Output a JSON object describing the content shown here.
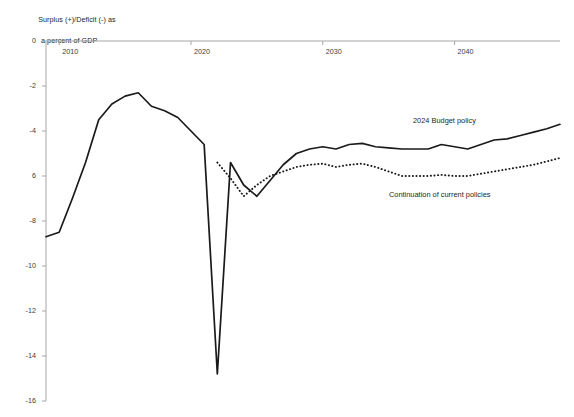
{
  "chart_data": {
    "type": "line",
    "title": "Surplus (+)/Deficit (-) as a percent of GDP",
    "title_line1": "Surplus (+)/Deficit (-) as",
    "title_line2": "a percent of GDP",
    "xlabel": "",
    "ylabel": "Surplus (+)/Deficit (-) as a percent of GDP",
    "xlim": [
      2009,
      2048
    ],
    "ylim": [
      -16,
      0
    ],
    "grid": false,
    "legend_position": "inline-annotation",
    "x_ticks": [
      2010,
      2020,
      2030,
      2040
    ],
    "x_tick_labels": [
      "2010",
      "2020",
      "2030",
      "2040"
    ],
    "y_ticks": [
      0,
      -2,
      -4,
      -6,
      -8,
      -10,
      -12,
      -14,
      -16
    ],
    "y_tick_labels": [
      "0",
      "-2",
      "-4",
      "-6",
      "6",
      "-8",
      "-10",
      "-12",
      "-14",
      "-16"
    ],
    "y_tick_labels_rendered": [
      "0",
      "-2",
      "-4",
      "6",
      "-8",
      "-10",
      "-12",
      "-14",
      "-16"
    ],
    "line_color": "#1a1a1a",
    "axis_color": "#a6a6a6",
    "series": [
      {
        "name": "2024 Budget policy",
        "style": "solid",
        "x": [
          2009,
          2010,
          2011,
          2012,
          2013,
          2014,
          2015,
          2016,
          2017,
          2018,
          2019,
          2020,
          2021,
          2022,
          2023,
          2024,
          2025,
          2026,
          2027,
          2028,
          2029,
          2030,
          2031,
          2032,
          2033,
          2034,
          2035,
          2036,
          2037,
          2038,
          2039,
          2040,
          2041,
          2042,
          2043,
          2044,
          2045,
          2046,
          2047,
          2048
        ],
        "values": [
          -8.7,
          -8.5,
          -7.0,
          -5.4,
          -3.5,
          -2.8,
          -2.45,
          -2.3,
          -2.9,
          -3.1,
          -3.4,
          -4.0,
          -4.6,
          -14.8,
          -5.4,
          -6.4,
          -6.9,
          -6.2,
          -5.5,
          -5.0,
          -4.8,
          -4.7,
          -4.8,
          -4.6,
          -4.55,
          -4.7,
          -4.75,
          -4.8,
          -4.8,
          -4.8,
          -4.6,
          -4.7,
          -4.8,
          -4.6,
          -4.4,
          -4.35,
          -4.2,
          -4.05,
          -3.9,
          -3.7
        ]
      },
      {
        "name": "Continuation of current policies",
        "style": "dotted",
        "x": [
          2022,
          2023,
          2024,
          2025,
          2026,
          2027,
          2028,
          2029,
          2030,
          2031,
          2032,
          2033,
          2034,
          2035,
          2036,
          2037,
          2038,
          2039,
          2040,
          2041,
          2042,
          2043,
          2044,
          2045,
          2046,
          2047,
          2048
        ],
        "values": [
          -5.4,
          -6.1,
          -6.9,
          -6.4,
          -6.0,
          -5.8,
          -5.6,
          -5.5,
          -5.45,
          -5.6,
          -5.5,
          -5.45,
          -5.6,
          -5.8,
          -6.0,
          -6.0,
          -6.0,
          -5.95,
          -6.0,
          -6.0,
          -5.9,
          -5.8,
          -5.7,
          -5.6,
          -5.5,
          -5.35,
          -5.2
        ]
      }
    ],
    "annotations": [
      {
        "text": "2024 Budget policy",
        "x_px": 413,
        "y_px": 116
      },
      {
        "text": "Continuation of current policies",
        "x_px": 389,
        "y_px": 190
      }
    ]
  }
}
